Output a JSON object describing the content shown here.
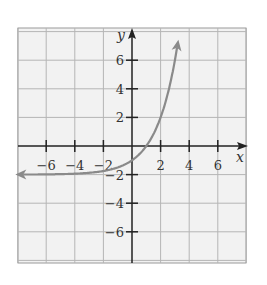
{
  "chart_data": {
    "type": "line",
    "title": "",
    "function": "y = 2^x - 2",
    "xlabel": "x",
    "ylabel": "y",
    "xlim": [
      -8,
      8
    ],
    "ylim": [
      -8,
      8
    ],
    "grid": true,
    "grid_step": 2,
    "x_ticks": [
      -6,
      -4,
      -2,
      2,
      4,
      6
    ],
    "y_ticks": [
      6,
      4,
      2,
      -2,
      -4,
      -6
    ],
    "x_tick_labels": [
      "−6",
      "−4",
      "−2",
      "2",
      "4",
      "6"
    ],
    "y_tick_labels": [
      "6",
      "4",
      "2",
      "−2",
      "−4",
      "−6"
    ],
    "asymptote": {
      "type": "horizontal",
      "y": -2
    },
    "series": [
      {
        "name": "curve",
        "color": "#8a8a8a",
        "arrows": [
          "left",
          "up"
        ],
        "x": [
          -8,
          -6,
          -4,
          -3,
          -2,
          -1,
          0,
          1,
          2,
          2.5,
          3,
          3.2
        ],
        "y": [
          -1.996,
          -1.984,
          -1.9375,
          -1.875,
          -1.75,
          -1.5,
          -1,
          0,
          2,
          3.66,
          6,
          7.19
        ]
      }
    ],
    "key_points": [
      {
        "x": 0,
        "y": -1,
        "label": "y-intercept"
      },
      {
        "x": 1,
        "y": 0,
        "label": "x-intercept"
      }
    ]
  },
  "colors": {
    "grid": "#b5b5b5",
    "grid_bg": "#f2f2f2",
    "axis": "#222222",
    "curve": "#8a8a8a"
  }
}
